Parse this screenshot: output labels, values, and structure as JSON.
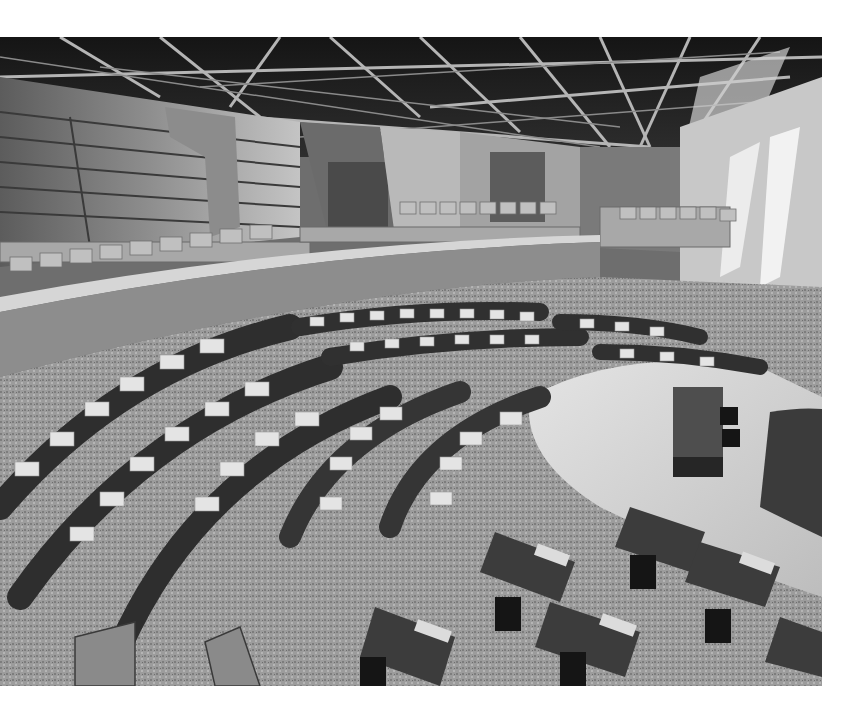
{
  "image": {
    "alt": "Grayscale architectural rendering of a parliamentary debating chamber viewed from above, with curved rows of desks and chairs arranged in a horseshoe, a central table on a light wooden floor, public galleries with seating, and an exposed timber/steel roof truss structure.",
    "palette": {
      "background": "#ffffff",
      "roof_dark": "#1c1c1c",
      "roof_beam": "#b8b8b8",
      "wall_mid": "#8a8a8a",
      "wall_light": "#c9c9c9",
      "carpet": "#9a9a9a",
      "floor_light": "#d8d8d8",
      "desk_dark": "#3a3a3a",
      "desk_paper": "#e6e6e6",
      "chair_black": "#151515"
    }
  }
}
